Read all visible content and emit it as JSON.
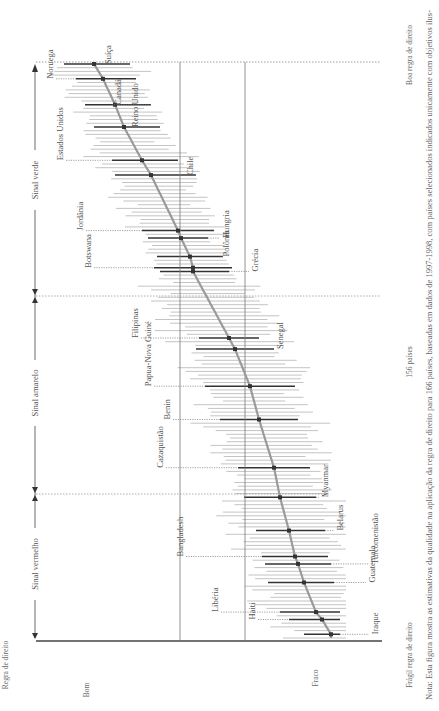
{
  "chart_data": {
    "type": "scatter",
    "orientation": "rotated-90-ccw",
    "title": "",
    "ylabel": "Regra de direito",
    "xlabel": "156 países",
    "y_axis_top_label": "Bom",
    "y_axis_bottom_label": "Fraco",
    "x_axis_left_label": "Frágil regra de direito",
    "x_axis_right_label": "Boa regra de direito",
    "zones": [
      {
        "name": "Sinal verde",
        "from_rank": 1,
        "to_rank": 62
      },
      {
        "name": "Sinal amarelo",
        "from_rank": 63,
        "to_rank": 114
      },
      {
        "name": "Sinal vermelho",
        "from_rank": 115,
        "to_rank": 156
      }
    ],
    "reference_lines": [
      {
        "name": "threshold-1",
        "value": 0.55
      },
      {
        "name": "threshold-2",
        "value": 0.77
      }
    ],
    "n_countries": 156,
    "score_range": [
      0,
      1
    ],
    "highlighted_countries": [
      {
        "name": "Suíça",
        "rank": 1,
        "estimate": 0.18,
        "low": 0.08,
        "high": 0.3
      },
      {
        "name": "Noruega",
        "rank": 5,
        "estimate": 0.21,
        "low": 0.12,
        "high": 0.32
      },
      {
        "name": "Canadá",
        "rank": 12,
        "estimate": 0.25,
        "low": 0.15,
        "high": 0.37
      },
      {
        "name": "Reino Unido",
        "rank": 18,
        "estimate": 0.28,
        "low": 0.18,
        "high": 0.4
      },
      {
        "name": "Estados Unidos",
        "rank": 27,
        "estimate": 0.34,
        "low": 0.24,
        "high": 0.46
      },
      {
        "name": "Chile",
        "rank": 31,
        "estimate": 0.37,
        "low": 0.25,
        "high": 0.52
      },
      {
        "name": "Jordânia",
        "rank": 46,
        "estimate": 0.46,
        "low": 0.34,
        "high": 0.58
      },
      {
        "name": "Hungria",
        "rank": 48,
        "estimate": 0.47,
        "low": 0.36,
        "high": 0.56
      },
      {
        "name": "Polônia",
        "rank": 53,
        "estimate": 0.5,
        "low": 0.39,
        "high": 0.61
      },
      {
        "name": "Botswana",
        "rank": 56,
        "estimate": 0.51,
        "low": 0.38,
        "high": 0.64
      },
      {
        "name": "Grécia",
        "rank": 57,
        "estimate": 0.51,
        "low": 0.4,
        "high": 0.63
      },
      {
        "name": "Filipinas",
        "rank": 75,
        "estimate": 0.63,
        "low": 0.53,
        "high": 0.73
      },
      {
        "name": "Senegal",
        "rank": 78,
        "estimate": 0.65,
        "low": 0.52,
        "high": 0.78
      },
      {
        "name": "Papua-Nova Guiné",
        "rank": 88,
        "estimate": 0.7,
        "low": 0.55,
        "high": 0.85
      },
      {
        "name": "Benin",
        "rank": 97,
        "estimate": 0.73,
        "low": 0.6,
        "high": 0.86
      },
      {
        "name": "Cazaquistão",
        "rank": 110,
        "estimate": 0.78,
        "low": 0.66,
        "high": 0.9
      },
      {
        "name": "Myanmar",
        "rank": 118,
        "estimate": 0.8,
        "low": 0.68,
        "high": 0.92
      },
      {
        "name": "Belarus",
        "rank": 127,
        "estimate": 0.83,
        "low": 0.72,
        "high": 0.95
      },
      {
        "name": "Bangladesh",
        "rank": 134,
        "estimate": 0.85,
        "low": 0.74,
        "high": 0.96
      },
      {
        "name": "Turcomenistão",
        "rank": 136,
        "estimate": 0.86,
        "low": 0.75,
        "high": 0.97
      },
      {
        "name": "Guatemala",
        "rank": 141,
        "estimate": 0.88,
        "low": 0.76,
        "high": 0.98
      },
      {
        "name": "Libéria",
        "rank": 149,
        "estimate": 0.92,
        "low": 0.8,
        "high": 1.0
      },
      {
        "name": "Haiti",
        "rank": 151,
        "estimate": 0.94,
        "low": 0.83,
        "high": 1.0
      },
      {
        "name": "Iraque",
        "rank": 155,
        "estimate": 0.97,
        "low": 0.88,
        "high": 1.0
      }
    ]
  },
  "note": "Nota: Esta figura mostra as estimativas da qualidade na aplicação da regra de direito para 166 países, baseadas em dados de 1997-1998, com países selecionados indicados unicamente com objetivos ilus-"
}
